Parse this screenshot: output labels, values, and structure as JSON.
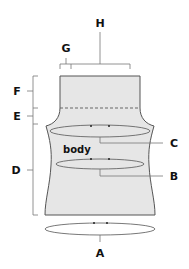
{
  "diagram": {
    "title": "",
    "body_label": "body",
    "labels": {
      "A": "A",
      "B": "B",
      "C": "C",
      "D": "D",
      "E": "E",
      "F": "F",
      "G": "G",
      "H": "H"
    },
    "colors": {
      "fill": "#e6e6e6",
      "outline": "#555555",
      "text": "#111111",
      "leader": "#777777"
    }
  }
}
